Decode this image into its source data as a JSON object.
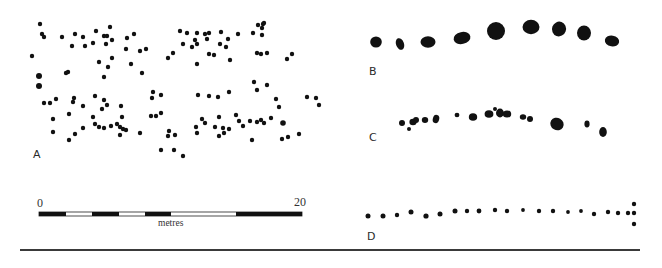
{
  "figure": {
    "ink_color": "#111111",
    "panels": [
      {
        "id": "A",
        "label": "A",
        "label_pos": [
          33,
          154
        ],
        "dot_radius": 2.2,
        "dots": [
          [
            40,
            24
          ],
          [
            42,
            34
          ],
          [
            44,
            37
          ],
          [
            62,
            37
          ],
          [
            75,
            34
          ],
          [
            83,
            37
          ],
          [
            96,
            31
          ],
          [
            110,
            27
          ],
          [
            104,
            36
          ],
          [
            107,
            36
          ],
          [
            112,
            40
          ],
          [
            127,
            38
          ],
          [
            134,
            34
          ],
          [
            72,
            46
          ],
          [
            85,
            46
          ],
          [
            93,
            43
          ],
          [
            106,
            44
          ],
          [
            32,
            56
          ],
          [
            126,
            49
          ],
          [
            140,
            51
          ],
          [
            146,
            49
          ],
          [
            99,
            62
          ],
          [
            112,
            58
          ],
          [
            108,
            67
          ],
          [
            131,
            64
          ],
          [
            104,
            77
          ],
          [
            142,
            73
          ],
          [
            66,
            73
          ],
          [
            68,
            72
          ],
          [
            39,
            76,
            3
          ],
          [
            39,
            86,
            3
          ],
          [
            44,
            103
          ],
          [
            50,
            103
          ],
          [
            56,
            99
          ],
          [
            74,
            98
          ],
          [
            73,
            102
          ],
          [
            95,
            96
          ],
          [
            104,
            100
          ],
          [
            107,
            105
          ],
          [
            83,
            106
          ],
          [
            102,
            109
          ],
          [
            121,
            106
          ],
          [
            69,
            114
          ],
          [
            93,
            117
          ],
          [
            53,
            119
          ],
          [
            122,
            117
          ],
          [
            53,
            132
          ],
          [
            83,
            128
          ],
          [
            95,
            124
          ],
          [
            99,
            127
          ],
          [
            104,
            128
          ],
          [
            111,
            126
          ],
          [
            117,
            124
          ],
          [
            120,
            127
          ],
          [
            123,
            129
          ],
          [
            126,
            130
          ],
          [
            120,
            135
          ],
          [
            75,
            134
          ],
          [
            69,
            140
          ],
          [
            140,
            133
          ],
          [
            152,
            98
          ],
          [
            153,
            92
          ],
          [
            161,
            95
          ],
          [
            151,
            116
          ],
          [
            156,
            116
          ],
          [
            161,
            113
          ],
          [
            168,
            58
          ],
          [
            173,
            53
          ],
          [
            180,
            31
          ],
          [
            187,
            33
          ],
          [
            197,
            33
          ],
          [
            205,
            34
          ],
          [
            209,
            33
          ],
          [
            221,
            32
          ],
          [
            195,
            40
          ],
          [
            183,
            44
          ],
          [
            192,
            47
          ],
          [
            197,
            44
          ],
          [
            207,
            39
          ],
          [
            228,
            39
          ],
          [
            220,
            44
          ],
          [
            226,
            47
          ],
          [
            238,
            34
          ],
          [
            253,
            33
          ],
          [
            258,
            25
          ],
          [
            263,
            24
          ],
          [
            264,
            23
          ],
          [
            262,
            28
          ],
          [
            262,
            35
          ],
          [
            209,
            54
          ],
          [
            214,
            55
          ],
          [
            230,
            60
          ],
          [
            197,
            64
          ],
          [
            257,
            53
          ],
          [
            261,
            54
          ],
          [
            267,
            53
          ],
          [
            287,
            59
          ],
          [
            292,
            54
          ],
          [
            254,
            82
          ],
          [
            257,
            90
          ],
          [
            267,
            85
          ],
          [
            229,
            92
          ],
          [
            198,
            95
          ],
          [
            209,
            96
          ],
          [
            218,
            97
          ],
          [
            276,
            99
          ],
          [
            279,
            107
          ],
          [
            307,
            97
          ],
          [
            316,
            98
          ],
          [
            319,
            105
          ],
          [
            169,
            131
          ],
          [
            175,
            135
          ],
          [
            168,
            136
          ],
          [
            161,
            150
          ],
          [
            174,
            150
          ],
          [
            183,
            156
          ],
          [
            196,
            127
          ],
          [
            197,
            133
          ],
          [
            202,
            119
          ],
          [
            205,
            123
          ],
          [
            215,
            127
          ],
          [
            219,
            136
          ],
          [
            223,
            128
          ],
          [
            224,
            133
          ],
          [
            229,
            129
          ],
          [
            219,
            117
          ],
          [
            236,
            115
          ],
          [
            239,
            121
          ],
          [
            243,
            126
          ],
          [
            250,
            121
          ],
          [
            257,
            122
          ],
          [
            261,
            120
          ],
          [
            264,
            123
          ],
          [
            271,
            118
          ],
          [
            283,
            123,
            2.8
          ],
          [
            252,
            140
          ],
          [
            282,
            139
          ],
          [
            288,
            137
          ],
          [
            299,
            134
          ]
        ]
      },
      {
        "id": "B",
        "label": "B",
        "label_pos": [
          370,
          66
        ],
        "blobs": [
          {
            "cx": 376,
            "cy": 42,
            "rx": 5.8,
            "ry": 5.6,
            "rot": 0
          },
          {
            "cx": 400,
            "cy": 44,
            "rx": 4.0,
            "ry": 6.0,
            "rot": -20
          },
          {
            "cx": 428,
            "cy": 42,
            "rx": 7.5,
            "ry": 5.8,
            "rot": 0
          },
          {
            "cx": 462,
            "cy": 38,
            "rx": 8.5,
            "ry": 6.0,
            "rot": -12
          },
          {
            "cx": 496,
            "cy": 31,
            "rx": 9.0,
            "ry": 9.0,
            "rot": 0
          },
          {
            "cx": 531,
            "cy": 27,
            "rx": 8.5,
            "ry": 7.2,
            "rot": 0
          },
          {
            "cx": 559,
            "cy": 29,
            "rx": 7.0,
            "ry": 7.4,
            "rot": 20
          },
          {
            "cx": 584,
            "cy": 33,
            "rx": 7.0,
            "ry": 7.6,
            "rot": 0
          },
          {
            "cx": 612,
            "cy": 41,
            "rx": 7.2,
            "ry": 5.4,
            "rot": 10
          }
        ]
      },
      {
        "id": "C",
        "label": "C",
        "label_pos": [
          370,
          133
        ],
        "blobs": [
          {
            "cx": 402,
            "cy": 123,
            "rx": 3.0,
            "ry": 3.0,
            "rot": 0
          },
          {
            "cx": 409,
            "cy": 129,
            "rx": 2.0,
            "ry": 2.0,
            "rot": 0
          },
          {
            "cx": 413,
            "cy": 122,
            "rx": 3.6,
            "ry": 3.2,
            "rot": 0
          },
          {
            "cx": 416,
            "cy": 120,
            "rx": 3.0,
            "ry": 3.0,
            "rot": 0
          },
          {
            "cx": 425,
            "cy": 120,
            "rx": 3.2,
            "ry": 3.0,
            "rot": 0
          },
          {
            "cx": 436,
            "cy": 119,
            "rx": 3.2,
            "ry": 4.2,
            "rot": 15
          },
          {
            "cx": 457,
            "cy": 115,
            "rx": 2.4,
            "ry": 2.2,
            "rot": 0
          },
          {
            "cx": 473,
            "cy": 117,
            "rx": 4.2,
            "ry": 3.8,
            "rot": 0
          },
          {
            "cx": 489,
            "cy": 114,
            "rx": 4.4,
            "ry": 3.8,
            "rot": 0
          },
          {
            "cx": 495,
            "cy": 109,
            "rx": 2.0,
            "ry": 2.0,
            "rot": 0
          },
          {
            "cx": 500,
            "cy": 113,
            "rx": 4.0,
            "ry": 4.4,
            "rot": 0
          },
          {
            "cx": 507,
            "cy": 114,
            "rx": 4.2,
            "ry": 3.6,
            "rot": 0
          },
          {
            "cx": 523,
            "cy": 117,
            "rx": 3.2,
            "ry": 2.8,
            "rot": 0
          },
          {
            "cx": 530,
            "cy": 119,
            "rx": 3.0,
            "ry": 3.0,
            "rot": 0
          },
          {
            "cx": 557,
            "cy": 124,
            "rx": 6.8,
            "ry": 6.2,
            "rot": 30
          },
          {
            "cx": 587,
            "cy": 124,
            "rx": 2.6,
            "ry": 3.4,
            "rot": 0
          },
          {
            "cx": 603,
            "cy": 132,
            "rx": 3.8,
            "ry": 5.0,
            "rot": 0
          }
        ]
      },
      {
        "id": "D",
        "label": "D",
        "label_pos": [
          368,
          235
        ],
        "dot_radius": 2.2,
        "dots": [
          [
            368,
            216,
            2.5
          ],
          [
            383,
            216,
            2.5
          ],
          [
            397,
            215
          ],
          [
            411,
            212,
            2.5
          ],
          [
            426,
            216,
            2.6
          ],
          [
            440,
            214,
            2.5
          ],
          [
            455,
            211,
            2.5
          ],
          [
            467,
            211
          ],
          [
            479,
            211,
            2.4
          ],
          [
            495,
            210
          ],
          [
            507,
            211
          ],
          [
            523,
            210,
            1.9
          ],
          [
            539,
            211
          ],
          [
            553,
            211
          ],
          [
            568,
            212,
            1.9
          ],
          [
            581,
            211,
            1.9
          ],
          [
            594,
            214
          ],
          [
            608,
            212
          ],
          [
            618,
            213
          ],
          [
            628,
            213
          ],
          [
            634,
            204
          ],
          [
            634,
            213
          ],
          [
            634,
            224
          ]
        ]
      }
    ],
    "scale_bar": {
      "start_label": "0",
      "end_label": "20",
      "unit_label": "metres",
      "x_start": 39,
      "x_end": 302,
      "y": 212,
      "height": 4,
      "segments": [
        {
          "from": 39,
          "to": 66,
          "fill": "black"
        },
        {
          "from": 66,
          "to": 92,
          "fill": "white"
        },
        {
          "from": 92,
          "to": 119,
          "fill": "black"
        },
        {
          "from": 119,
          "to": 145,
          "fill": "white"
        },
        {
          "from": 145,
          "to": 171,
          "fill": "black"
        },
        {
          "from": 171,
          "to": 236,
          "fill": "white"
        },
        {
          "from": 236,
          "to": 302,
          "fill": "black"
        }
      ]
    },
    "bottom_rule": {
      "x1": 20,
      "x2": 640,
      "y": 250
    }
  }
}
